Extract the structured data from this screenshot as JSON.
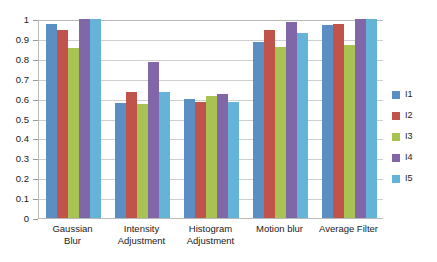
{
  "chart_data": {
    "type": "bar",
    "title": "",
    "xlabel": "",
    "ylabel": "",
    "ylim": [
      0,
      1
    ],
    "ytick_labels": [
      "1",
      "0.9",
      "0.8",
      "0.7",
      "0.6",
      "0.5",
      "0.4",
      "0.3",
      "0.2",
      "0.1",
      "0"
    ],
    "ytick_values": [
      1,
      0.9,
      0.8,
      0.7,
      0.6,
      0.5,
      0.4,
      0.3,
      0.2,
      0.1,
      0
    ],
    "grid": true,
    "legend_position": "right",
    "categories": [
      "Gaussian\nBlur",
      "Intensity\nAdjustment",
      "Histogram\nAdjustment",
      "Motion blur",
      "Average Filter"
    ],
    "series": [
      {
        "name": "I1",
        "color": "#5b8fc4",
        "values": [
          0.975,
          0.58,
          0.598,
          0.885,
          0.97
        ]
      },
      {
        "name": "I2",
        "color": "#c1544a",
        "values": [
          0.945,
          0.632,
          0.583,
          0.945,
          0.975
        ]
      },
      {
        "name": "I3",
        "color": "#a8c352",
        "values": [
          0.855,
          0.572,
          0.615,
          0.86,
          0.87
        ]
      },
      {
        "name": "I4",
        "color": "#8267a8",
        "values": [
          1.0,
          0.785,
          0.625,
          0.985,
          1.0
        ]
      },
      {
        "name": "I5",
        "color": "#64b3d8",
        "values": [
          1.0,
          0.635,
          0.582,
          0.93,
          1.0
        ]
      }
    ]
  }
}
